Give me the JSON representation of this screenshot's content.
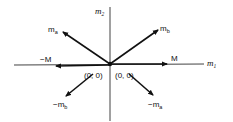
{
  "diagram": {
    "axes": {
      "horizontal": {
        "label": "m",
        "subscript": "1"
      },
      "vertical": {
        "label": "m",
        "subscript": "2"
      }
    },
    "origin_labels": [
      "(0, 0)",
      "(0, 0)"
    ],
    "vectors": [
      {
        "id": "ma",
        "label": "m",
        "subscript": "a",
        "direction": "up-left"
      },
      {
        "id": "mb",
        "label": "m",
        "subscript": "b",
        "direction": "up-right"
      },
      {
        "id": "M",
        "label": "M",
        "subscript": "",
        "direction": "right"
      },
      {
        "id": "negM",
        "label": "−M",
        "subscript": "",
        "direction": "left"
      },
      {
        "id": "neg-mb",
        "label": "−m",
        "subscript": "b",
        "direction": "down-left (offset)"
      },
      {
        "id": "neg-ma",
        "label": "−m",
        "subscript": "a",
        "direction": "down-right (offset)"
      }
    ],
    "colors": {
      "ink": "#111111",
      "background": "#ffffff"
    }
  }
}
